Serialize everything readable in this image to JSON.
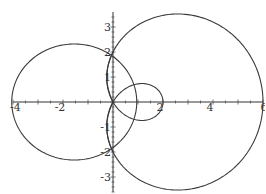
{
  "chart_data": {
    "type": "line",
    "title": "",
    "xlabel": "",
    "ylabel": "",
    "xlim": [
      -4,
      6
    ],
    "ylim": [
      -3.5,
      3.5
    ],
    "grid": false,
    "x_tick_labels": [
      "-4",
      "-2",
      "2",
      "4",
      "6"
    ],
    "y_tick_labels": [
      "3",
      "2",
      "1",
      "-1",
      "-2",
      "-3"
    ],
    "series": [
      {
        "name": "limacon r = 2 + 4cos(theta)",
        "description": "outer loop through (6,0),(0,2),(0,-2); inner loop from origin to (2,0)"
      },
      {
        "name": "left closed curve",
        "description": "through (-4,0),(0,2),(0,-2), peak near (-1.4,2.3)"
      },
      {
        "name": "inner arc",
        "description": "from (0,2) to (0,-2) bulging left to about x=-0.24"
      }
    ]
  },
  "axes": {
    "x_labels": [
      {
        "text": "-4",
        "v": -4
      },
      {
        "text": "-2",
        "v": -2
      },
      {
        "text": "2",
        "v": 2
      },
      {
        "text": "4",
        "v": 4
      },
      {
        "text": "6",
        "v": 6
      }
    ],
    "y_labels": [
      {
        "text": "3",
        "v": 3
      },
      {
        "text": "2",
        "v": 2
      },
      {
        "text": "1",
        "v": 1
      },
      {
        "text": "-1",
        "v": -1
      },
      {
        "text": "-2",
        "v": -2
      },
      {
        "text": "-3",
        "v": -3
      }
    ]
  }
}
